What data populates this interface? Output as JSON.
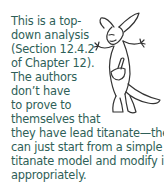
{
  "margin_note": {
    "lines": [
      "This is a top-",
      "down analysis",
      "(Section 12.4.2",
      "of Chapter 12).",
      "The authors",
      "don’t have",
      "to prove to",
      "themselves that",
      "they have lead titanate—they",
      "can just start from a simple lead",
      "titanate model and modify it",
      "appropriately."
    ],
    "text_color": "#2f5f58"
  },
  "illustration": {
    "subject": "kangaroo-cartoon",
    "description": "Line drawing of a kangaroo with raised paws and a pen in its pouch"
  }
}
